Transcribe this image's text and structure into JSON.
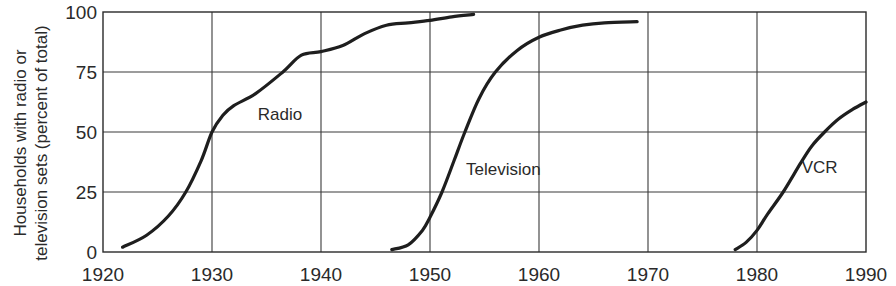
{
  "chart_data": {
    "type": "line",
    "title": "",
    "xlabel": "",
    "ylabel": "Households with radio or television sets (percent of total)",
    "ylabel_lines": [
      "Households with radio or",
      "television sets (percent of total)"
    ],
    "xlim": [
      1920,
      1990
    ],
    "ylim": [
      0,
      100
    ],
    "x_ticks": [
      1920,
      1930,
      1940,
      1950,
      1960,
      1970,
      1980,
      1990
    ],
    "y_ticks": [
      0,
      25,
      50,
      75,
      100
    ],
    "grid": true,
    "legend": "inline labels",
    "series": [
      {
        "name": "Radio",
        "label_pos": {
          "x": 1934.2,
          "y": 55
        },
        "points": [
          [
            1921.8,
            2
          ],
          [
            1924,
            7
          ],
          [
            1926,
            15
          ],
          [
            1927.6,
            25
          ],
          [
            1929,
            38
          ],
          [
            1930,
            50
          ],
          [
            1931,
            57
          ],
          [
            1932,
            61
          ],
          [
            1934,
            66
          ],
          [
            1936.5,
            75
          ],
          [
            1938.2,
            82
          ],
          [
            1940,
            83.5
          ],
          [
            1942,
            86
          ],
          [
            1944,
            91
          ],
          [
            1946,
            94.5
          ],
          [
            1948,
            95.5
          ],
          [
            1950,
            96.5
          ],
          [
            1952,
            98
          ],
          [
            1954,
            99
          ]
        ]
      },
      {
        "name": "Television",
        "label_pos": {
          "x": 1953.3,
          "y": 32
        },
        "points": [
          [
            1946.5,
            1
          ],
          [
            1948,
            3
          ],
          [
            1949.3,
            9
          ],
          [
            1950,
            14.5
          ],
          [
            1951.1,
            25
          ],
          [
            1952.2,
            38
          ],
          [
            1953.2,
            50
          ],
          [
            1954.5,
            64
          ],
          [
            1956,
            75
          ],
          [
            1958,
            84
          ],
          [
            1960,
            89.5
          ],
          [
            1962,
            92.5
          ],
          [
            1964,
            94.5
          ],
          [
            1966,
            95.5
          ],
          [
            1969,
            96
          ]
        ]
      },
      {
        "name": "VCR",
        "label_pos": {
          "x": 1984.1,
          "y": 33
        },
        "points": [
          [
            1978,
            1
          ],
          [
            1979,
            4
          ],
          [
            1980,
            9
          ],
          [
            1981,
            16
          ],
          [
            1982.4,
            25
          ],
          [
            1984,
            37
          ],
          [
            1985,
            44
          ],
          [
            1986.2,
            50
          ],
          [
            1987.5,
            55.5
          ],
          [
            1988.8,
            59.5
          ],
          [
            1990,
            62.5
          ]
        ]
      }
    ]
  },
  "axes": {
    "x_tick_labels": [
      "1920",
      "1930",
      "1940",
      "1950",
      "1960",
      "1970",
      "1980",
      "1990"
    ],
    "y_tick_labels": [
      "0",
      "25",
      "50",
      "75",
      "100"
    ]
  },
  "colors": {
    "curve": "#1e1e1e",
    "grid": "#3a3a3a",
    "text": "#2a2a2a",
    "background": "#ffffff"
  }
}
